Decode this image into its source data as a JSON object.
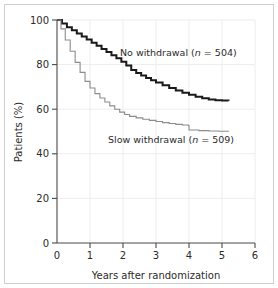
{
  "chart_data": {
    "type": "line",
    "title": "",
    "subtitle": "",
    "xlabel": "Years after randomization",
    "ylabel": "Patients (%)",
    "xlim": [
      0,
      6
    ],
    "ylim": [
      0,
      100
    ],
    "xticks": [
      0,
      1,
      2,
      3,
      4,
      5,
      6
    ],
    "xtick_labels": [
      "0",
      "1",
      "2",
      "3",
      "4",
      "5",
      "6"
    ],
    "yticks": [
      0,
      20,
      40,
      60,
      80,
      100
    ],
    "ytick_labels": [
      "0",
      "20",
      "40",
      "60",
      "80",
      "100"
    ],
    "grid": true,
    "grid_color": "#ededed",
    "legend_position": "inline-annotation",
    "step": "post",
    "series": [
      {
        "name": "No withdrawal",
        "n": 504,
        "label": "No withdrawal (n = 504)",
        "label_prefix": "No withdrawal (",
        "label_n": "n",
        "label_suffix": " = 504)",
        "color": "#1a1a1a",
        "line_width": 2.0,
        "x": [
          0,
          0.15,
          0.3,
          0.45,
          0.6,
          0.75,
          0.9,
          1.05,
          1.2,
          1.35,
          1.5,
          1.65,
          1.8,
          1.95,
          2.1,
          2.25,
          2.4,
          2.55,
          2.7,
          2.85,
          3.0,
          3.2,
          3.4,
          3.6,
          3.8,
          4.0,
          4.2,
          4.4,
          4.6,
          4.8,
          5.0,
          5.2
        ],
        "y": [
          100,
          98.4,
          96.8,
          95.4,
          94.0,
          92.6,
          91.2,
          89.8,
          88.4,
          87.0,
          85.6,
          84.2,
          82.8,
          81.3,
          79.6,
          77.6,
          76.2,
          75.1,
          74.0,
          73.0,
          72.0,
          70.7,
          69.5,
          68.4,
          67.4,
          66.5,
          65.6,
          64.9,
          64.3,
          64.0,
          63.9,
          63.8
        ]
      },
      {
        "name": "Slow withdrawal",
        "n": 509,
        "label": "Slow withdrawal (n = 509)",
        "label_prefix": "Slow withdrawal (",
        "label_n": "n",
        "label_suffix": " = 509)",
        "color": "#8c8c8c",
        "line_width": 1.1,
        "x": [
          0,
          0.12,
          0.25,
          0.4,
          0.55,
          0.7,
          0.85,
          1.0,
          1.15,
          1.3,
          1.45,
          1.6,
          1.75,
          1.9,
          2.05,
          2.2,
          2.4,
          2.6,
          2.8,
          3.0,
          3.2,
          3.4,
          3.6,
          3.8,
          3.98,
          4.0,
          4.3,
          4.6,
          4.9,
          5.2
        ],
        "y": [
          100,
          96.0,
          91.0,
          86.0,
          81.0,
          76.5,
          72.5,
          69.5,
          67.0,
          65.0,
          63.2,
          61.5,
          60.0,
          58.7,
          57.6,
          56.8,
          56.1,
          55.5,
          55.0,
          54.5,
          54.0,
          53.6,
          53.2,
          52.9,
          52.7,
          50.7,
          50.4,
          50.2,
          50.1,
          50.0
        ]
      }
    ],
    "annotations": [
      {
        "name": "no-withdrawal-label",
        "text": "No withdrawal (n = 504)",
        "x_px": 120,
        "y_px": 56
      },
      {
        "name": "slow-withdrawal-label",
        "text": "Slow withdrawal (n = 509)",
        "x_px": 108,
        "y_px": 143
      }
    ]
  },
  "figure": {
    "border_color": "#cfcfcf",
    "background": "#ffffff",
    "axis_color": "#4a4a4a",
    "text_color": "#2b2b2b"
  }
}
